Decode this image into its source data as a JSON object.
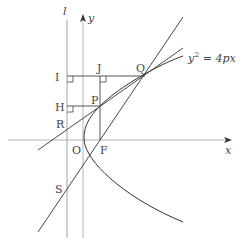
{
  "diagram": {
    "labels": {
      "l": "l",
      "y": "y",
      "x": "x",
      "I": "I",
      "J": "J",
      "Q": "Q",
      "H": "H",
      "P": "P",
      "R": "R",
      "O": "O",
      "F": "F",
      "S": "S",
      "equation_main": "y",
      "equation_sup": "2",
      "equation_rest": " = 4px"
    },
    "colors": {
      "line": "#333333",
      "axis": "#999999",
      "text": "#444444"
    }
  }
}
